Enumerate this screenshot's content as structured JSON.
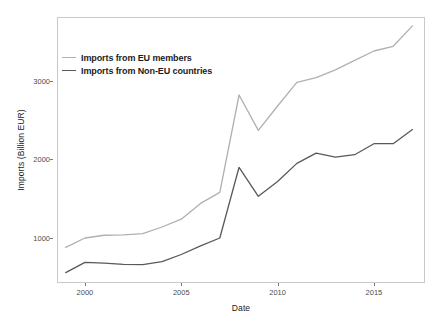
{
  "chart_data": {
    "type": "line",
    "title": "",
    "xlabel": "Date",
    "ylabel": "Imports (Billion EUR)",
    "xlim": [
      1998.6,
      2017.6
    ],
    "ylim": [
      440,
      3800
    ],
    "grid": false,
    "legend_position": "top-left inside panel",
    "x_ticks": [
      2000,
      2005,
      2010,
      2015
    ],
    "x_tick_labels": [
      "2000",
      "2005",
      "2010",
      "2015"
    ],
    "y_ticks": [
      1000,
      2000,
      3000
    ],
    "y_tick_labels": [
      "1000",
      "2000",
      "3000"
    ],
    "x": [
      1999,
      2000,
      2001,
      2002,
      2003,
      2004,
      2005,
      2006,
      2007,
      2008,
      2009,
      2010,
      2011,
      2012,
      2013,
      2014,
      2015,
      2016,
      2017
    ],
    "series": [
      {
        "name": "Imports from EU members",
        "color": "#b0b0b0",
        "values": [
          880,
          1000,
          1035,
          1040,
          1055,
          1140,
          1240,
          1440,
          1580,
          2820,
          2370,
          2680,
          2980,
          3040,
          3140,
          3260,
          3380,
          3440,
          3700
        ]
      },
      {
        "name": "Imports from Non-EU countries",
        "color": "#595959",
        "values": [
          560,
          690,
          680,
          665,
          660,
          700,
          790,
          900,
          1000,
          1900,
          1530,
          1720,
          1950,
          2080,
          2030,
          2060,
          2200,
          2200,
          2380
        ]
      }
    ]
  },
  "legend": {
    "items": [
      {
        "label": "Imports from EU members",
        "color": "#b0b0b0"
      },
      {
        "label": "Imports from Non-EU countries",
        "color": "#595959"
      }
    ]
  },
  "axes": {
    "x_title": "Date",
    "y_title": "Imports (Billion EUR)"
  },
  "colors": {
    "panel_background": "#ffffff",
    "panel_border": "#c9c9c9",
    "tick_label": "#4d4d4d",
    "axis_title": "#1a1a1a",
    "series_eu": "#b0b0b0",
    "series_non_eu": "#595959"
  }
}
